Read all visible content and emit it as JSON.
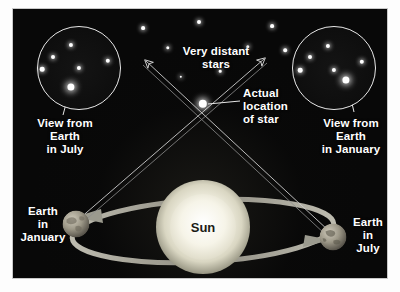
{
  "figure": {
    "title_alt": "Stellar parallax diagram",
    "panel_background": "#080808",
    "frame_background": "#fdfdfd",
    "star_color": "#ffffff",
    "sun_color": "#f2f0e2",
    "orbit_color": "#a8a69a",
    "sightline_color": "#cfcfcf",
    "label_color": "#ffffff",
    "sun_label_color": "#1b1b16"
  },
  "labels": {
    "very_distant_stars": "Very distant\nstars",
    "actual_location": "Actual\nlocation\nof star",
    "view_july": "View from\nEarth\nin July",
    "view_january": "View from\nEarth\nin January",
    "earth_january": "Earth\nin\nJanuary",
    "earth_july": "Earth\nin\nJuly",
    "sun": "Sun"
  },
  "insets": {
    "left": {
      "name": "view-from-earth-in-july",
      "caption": "View from\nEarth\nin July",
      "cx": 66,
      "cy": 59,
      "r": 41,
      "target_star": {
        "x": 58,
        "y": 78,
        "r": 3.6,
        "label": "parallax-star"
      },
      "field_stars": [
        {
          "x": 58,
          "y": 36,
          "r": 2.1
        },
        {
          "x": 40,
          "y": 48,
          "r": 2.0
        },
        {
          "x": 29,
          "y": 60,
          "r": 2.3
        },
        {
          "x": 66,
          "y": 59,
          "r": 2.1
        },
        {
          "x": 95,
          "y": 52,
          "r": 2.2
        }
      ]
    },
    "right": {
      "name": "view-from-earth-in-january",
      "caption": "View from\nEarth\nin January",
      "cx": 321,
      "cy": 59,
      "r": 41,
      "target_star": {
        "x": 333,
        "y": 71,
        "r": 3.6,
        "label": "parallax-star"
      },
      "field_stars": [
        {
          "x": 315,
          "y": 37,
          "r": 2.1
        },
        {
          "x": 297,
          "y": 48,
          "r": 2.0
        },
        {
          "x": 287,
          "y": 61,
          "r": 2.3
        },
        {
          "x": 321,
          "y": 61,
          "r": 2.1
        },
        {
          "x": 349,
          "y": 53,
          "r": 2.2
        }
      ]
    }
  },
  "background_stars": [
    {
      "x": 130,
      "y": 19,
      "r": 1.9
    },
    {
      "x": 155,
      "y": 39,
      "r": 1.7
    },
    {
      "x": 186,
      "y": 13,
      "r": 2.0
    },
    {
      "x": 235,
      "y": 38,
      "r": 1.7
    },
    {
      "x": 259,
      "y": 17,
      "r": 1.9
    },
    {
      "x": 272,
      "y": 41,
      "r": 1.8
    },
    {
      "x": 207,
      "y": 62,
      "r": 1.3
    },
    {
      "x": 168,
      "y": 68,
      "r": 1.2
    }
  ],
  "actual_star": {
    "x": 190,
    "y": 95,
    "r": 4.2,
    "name": "actual-star-position"
  },
  "sun": {
    "x": 190,
    "y": 218,
    "r": 47,
    "name": "sun-body"
  },
  "earths": [
    {
      "name": "earth-in-january",
      "x": 63,
      "y": 215,
      "r": 13.5,
      "caption": "Earth\nin\nJanuary",
      "caption_side": "left"
    },
    {
      "name": "earth-in-july",
      "x": 320,
      "y": 228,
      "r": 13.5,
      "caption": "Earth\nin\nJuly",
      "caption_side": "right"
    }
  ],
  "orbit": {
    "name": "earth-orbit-ellipse",
    "cx": 190,
    "cy": 222,
    "rx": 131,
    "ry": 31,
    "rotation_deg": -3,
    "direction_arrow_left": true,
    "direction_arrow_right": true
  },
  "sightlines": [
    {
      "name": "sightline-july",
      "from": [
        63,
        215
      ],
      "to": [
        253,
        48
      ]
    },
    {
      "name": "sightline-january",
      "from": [
        320,
        228
      ],
      "to": [
        130,
        50
      ]
    }
  ],
  "leaders": [
    {
      "name": "leader-left-inset",
      "from": [
        50,
        106
      ],
      "to": [
        57,
        80
      ]
    },
    {
      "name": "leader-right-inset",
      "from": [
        341,
        103
      ],
      "to": [
        334,
        73
      ]
    },
    {
      "name": "leader-actual-star",
      "from": [
        225,
        92
      ],
      "to": [
        194,
        95
      ]
    }
  ]
}
